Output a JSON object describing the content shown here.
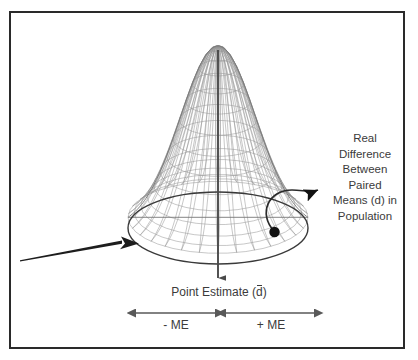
{
  "figure": {
    "title_present": false,
    "border_color": "#2a2a2a",
    "background": "#ffffff",
    "mesh_color": "#8d8d8d",
    "outline_color": "#3a3a3a",
    "arrow_color": "#4a4a4a",
    "dot_color": "#111111"
  },
  "labels": {
    "side": [
      "Real",
      "Difference",
      "Between",
      "Paired",
      "Means (d) in",
      "Population"
    ],
    "point_estimate_prefix": "Point Estimate (",
    "point_estimate_symbol": "d",
    "point_estimate_suffix": ")",
    "me_negative": "- ME",
    "me_positive": "+ ME"
  },
  "chart_data": {
    "type": "area",
    "title": "",
    "xlabel": "",
    "ylabel": "",
    "mesh": {
      "apex": [
        218,
        46
      ],
      "base_center": [
        218,
        228
      ],
      "base_rx": 90,
      "base_ry": 36,
      "grid_u": 30,
      "grid_v": 14,
      "sigma": 0.42
    },
    "annotations": [
      {
        "name": "point-estimate-arrow",
        "x1": 218,
        "y1": 52,
        "x2": 218,
        "y2": 282,
        "style": "down-arrow"
      },
      {
        "name": "me-negative-arrow",
        "x1": 133,
        "y1": 313,
        "x2": 218,
        "y2": 313,
        "style": "double-arrow"
      },
      {
        "name": "me-positive-arrow",
        "x1": 223,
        "y1": 313,
        "x2": 317,
        "y2": 313,
        "style": "double-arrow"
      },
      {
        "name": "population-difference-arrow",
        "from": [
          275,
          232
        ],
        "to": [
          320,
          186
        ],
        "style": "curved-arrow"
      },
      {
        "name": "tail-arrow",
        "from": [
          20,
          261
        ],
        "to": [
          131,
          242
        ],
        "style": "tapered-arrow"
      }
    ]
  }
}
